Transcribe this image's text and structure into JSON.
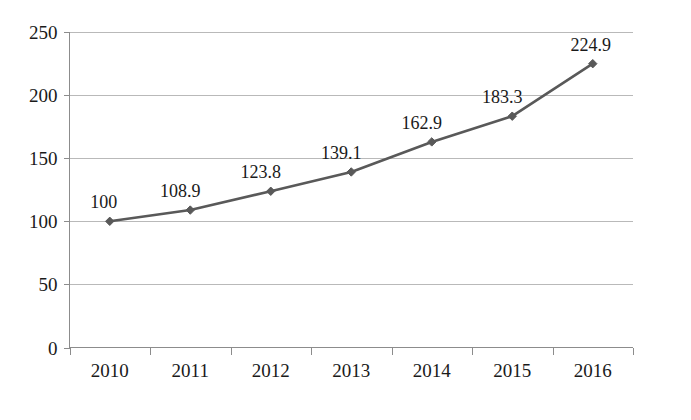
{
  "chart_data": {
    "type": "line",
    "title": "",
    "subtitle": "",
    "xlabel": "年份",
    "ylabel": "",
    "categories": [
      "2010",
      "2011",
      "2012",
      "2013",
      "2014",
      "2015",
      "2016"
    ],
    "values": [
      100,
      108.9,
      123.8,
      139.1,
      162.9,
      183.3,
      224.9
    ],
    "data_labels": [
      "100",
      "108.9",
      "123.8",
      "139.1",
      "162.9",
      "183.3",
      "224.9"
    ],
    "series": [
      {
        "name": "",
        "values": [
          100,
          108.9,
          123.8,
          139.1,
          162.9,
          183.3,
          224.9
        ],
        "color": "#595959",
        "marker": "diamond"
      }
    ],
    "ylim": [
      0,
      250
    ],
    "ytick_labels": [
      "0",
      "50",
      "100",
      "150",
      "200",
      "250"
    ],
    "ytick_values": [
      0,
      50,
      100,
      150,
      200,
      250
    ],
    "xtick_labels": [
      "2010",
      "2011",
      "2012",
      "2013",
      "2014",
      "2015",
      "2016"
    ],
    "grid": "horizontal",
    "legend": "none",
    "colors": {
      "series": "#595959",
      "gridline": "#b9b9b9",
      "axis": "#8c8c8c",
      "text": "#1a1a1a",
      "background": "#ffffff"
    }
  },
  "axis_titles": {
    "x": "年份"
  },
  "caption": {
    "text": ""
  }
}
